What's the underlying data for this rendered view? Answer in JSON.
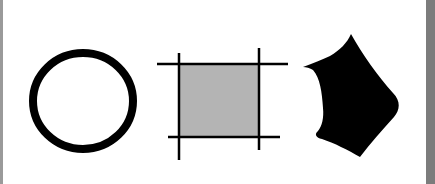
{
  "figure": {
    "shapes": [
      {
        "id": "circle",
        "kind": "hollow-circle",
        "stroke": "#000000",
        "fill": "none",
        "cx": 83,
        "cy": 101,
        "rx": 50,
        "ry": 48,
        "stroke_width": 8
      },
      {
        "id": "square",
        "kind": "filled-square-with-crossing-lines",
        "fill": "#b4b4b4",
        "stroke": "#000000",
        "x": 180,
        "y": 64,
        "width": 79,
        "height": 73,
        "lines": [
          {
            "x1": 157,
            "y1": 64,
            "x2": 288,
            "y2": 64
          },
          {
            "x1": 168,
            "y1": 137,
            "x2": 280,
            "y2": 137
          },
          {
            "x1": 179,
            "y1": 53,
            "x2": 179,
            "y2": 160
          },
          {
            "x1": 259,
            "y1": 48,
            "x2": 259,
            "y2": 150
          }
        ]
      },
      {
        "id": "blob",
        "kind": "irregular-solid-shape",
        "fill": "#000000"
      }
    ],
    "colors": {
      "background": "#ffffff",
      "left_border": "#9a9a9a",
      "right_bar": "#7c7c7c",
      "square_fill": "#b4b4b4",
      "ink": "#000000"
    }
  }
}
